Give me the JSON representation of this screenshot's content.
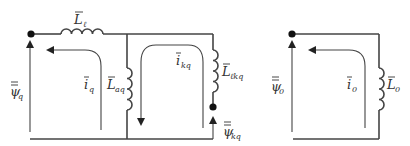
{
  "diagram": {
    "colors": {
      "wire": "#444444",
      "text": "#333333",
      "background": "#ffffff"
    },
    "q_circuit": {
      "labels": {
        "leakage_inductance": "L",
        "leakage_sub": "ℓ",
        "magnetizing_inductance": "L",
        "magnetizing_sub": "aq",
        "damper_inductance": "L",
        "damper_sub": "ℓkq",
        "stator_current": "i",
        "stator_current_sub": "q",
        "damper_current": "i",
        "damper_current_sub": "kq",
        "stator_flux": "ψ",
        "stator_flux_sub": "q",
        "damper_flux": "ψ",
        "damper_flux_sub": "kq"
      }
    },
    "zero_circuit": {
      "labels": {
        "inductance": "L",
        "inductance_sub": "0",
        "current": "i",
        "current_sub": "0",
        "flux": "ψ",
        "flux_sub": "0"
      }
    }
  }
}
